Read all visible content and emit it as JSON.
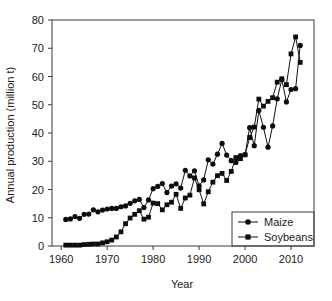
{
  "chart_data": {
    "type": "scatter",
    "title": "",
    "xlabel": "Year",
    "ylabel": "Annual production (million t)",
    "xlim": [
      1958,
      2015
    ],
    "ylim": [
      0,
      80
    ],
    "xticks": [
      1960,
      1970,
      1980,
      1990,
      2000,
      2010
    ],
    "yticks": [
      0,
      10,
      20,
      30,
      40,
      50,
      60,
      70,
      80
    ],
    "xtick_labels": [
      "1960",
      "1970",
      "1980",
      "1990",
      "2000",
      "2010"
    ],
    "ytick_labels": [
      "0",
      "10",
      "20",
      "30",
      "40",
      "50",
      "60",
      "70",
      "80"
    ],
    "grid": false,
    "legend_position": "bottom-right",
    "marker_color": "#0d0d0d",
    "line_color": "#111111",
    "series": [
      {
        "name": "Maize",
        "marker": "circle",
        "x": [
          1961,
          1962,
          1963,
          1964,
          1965,
          1966,
          1967,
          1968,
          1969,
          1970,
          1971,
          1972,
          1973,
          1974,
          1975,
          1976,
          1977,
          1978,
          1979,
          1980,
          1981,
          1982,
          1983,
          1984,
          1985,
          1986,
          1987,
          1988,
          1989,
          1990,
          1991,
          1992,
          1993,
          1994,
          1995,
          1996,
          1997,
          1998,
          1999,
          2000,
          2001,
          2002,
          2003,
          2004,
          2005,
          2006,
          2007,
          2008,
          2009,
          2010,
          2011,
          2012
        ],
        "y": [
          9.4,
          9.6,
          10.4,
          9.8,
          11.2,
          11.3,
          12.8,
          12.1,
          12.7,
          13.1,
          13.3,
          13.3,
          13.9,
          14.2,
          15.1,
          16.0,
          16.5,
          13.6,
          16.3,
          20.3,
          21.1,
          22.1,
          18.9,
          21.2,
          22.0,
          20.5,
          26.8,
          24.8,
          26.6,
          21.3,
          23.4,
          30.5,
          29.0,
          32.5,
          36.3,
          32.2,
          30.2,
          29.6,
          32.0,
          32.3,
          41.9,
          35.5,
          48.0,
          42.0,
          35.0,
          42.5,
          52.1,
          58.9,
          51.0,
          55.4,
          55.7,
          71.0
        ]
      },
      {
        "name": "Soybeans",
        "marker": "square",
        "x": [
          1961,
          1962,
          1963,
          1964,
          1965,
          1966,
          1967,
          1968,
          1969,
          1970,
          1971,
          1972,
          1973,
          1974,
          1975,
          1976,
          1977,
          1978,
          1979,
          1980,
          1981,
          1982,
          1983,
          1984,
          1985,
          1986,
          1987,
          1988,
          1989,
          1990,
          1991,
          1992,
          1993,
          1994,
          1995,
          1996,
          1997,
          1998,
          1999,
          2000,
          2001,
          2002,
          2003,
          2004,
          2005,
          2006,
          2007,
          2008,
          2009,
          2010,
          2011,
          2012
        ],
        "y": [
          0.3,
          0.3,
          0.3,
          0.3,
          0.5,
          0.6,
          0.7,
          0.7,
          1.1,
          1.5,
          2.1,
          3.2,
          5.0,
          7.9,
          9.9,
          11.2,
          12.5,
          9.5,
          10.2,
          15.2,
          15.0,
          12.8,
          14.6,
          15.5,
          18.3,
          13.3,
          17.0,
          18.0,
          24.1,
          19.9,
          14.9,
          19.2,
          22.6,
          24.9,
          25.7,
          23.2,
          26.4,
          31.3,
          30.9,
          32.3,
          38.4,
          42.1,
          52.0,
          49.5,
          51.2,
          52.5,
          58.0,
          59.2,
          57.1,
          68.0,
          74.0,
          65.0
        ]
      }
    ]
  },
  "legend": {
    "items": [
      {
        "label": "Maize",
        "marker": "circle"
      },
      {
        "label": "Soybeans",
        "marker": "square"
      }
    ]
  }
}
